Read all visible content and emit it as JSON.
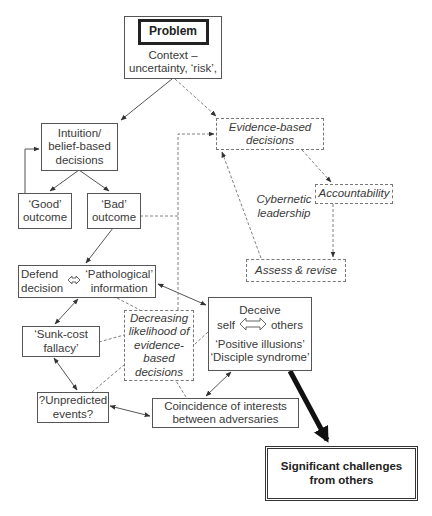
{
  "nodes": {
    "problem": {
      "title": "Problem",
      "line1": "Context –",
      "line2": "uncertainty, ‘risk’,"
    },
    "intuition": {
      "line1": "Intuition/",
      "line2": "belief-based",
      "line3": "decisions"
    },
    "good": {
      "line1": "‘Good’",
      "line2": "outcome"
    },
    "bad": {
      "line1": "‘Bad’",
      "line2": "outcome"
    },
    "evidence": {
      "line1": "Evidence-based",
      "line2": "decisions"
    },
    "accountability": {
      "label": "Accountability"
    },
    "cybernetic": {
      "line1": "Cybernetic",
      "line2": "leadership"
    },
    "assess": {
      "label": "Assess & revise"
    },
    "defend": {
      "left1": "Defend",
      "left2": "decision",
      "right1": "‘Pathological’",
      "right2": "information"
    },
    "deceive": {
      "title": "Deceive",
      "left": "self",
      "right": "others",
      "line3": "‘Positive illusions’",
      "line4": "‘Disciple syndrome’"
    },
    "sunk": {
      "line1": "‘Sunk-cost",
      "line2": "fallacy’"
    },
    "decreasing": {
      "line1": "Decreasing",
      "line2": "likelihood of",
      "line3": "evidence-",
      "line4": "based",
      "line5": "decisions"
    },
    "unpredicted": {
      "line1": "?Unpredicted",
      "line2": "events?"
    },
    "coincidence": {
      "line1": "Coincidence of interests",
      "line2": "between adversaries"
    },
    "significant": {
      "line1": "Significant challenges",
      "line2": "from others"
    }
  },
  "colors": {
    "line": "#555555",
    "dashed": "#808080",
    "thick": "#111111"
  }
}
